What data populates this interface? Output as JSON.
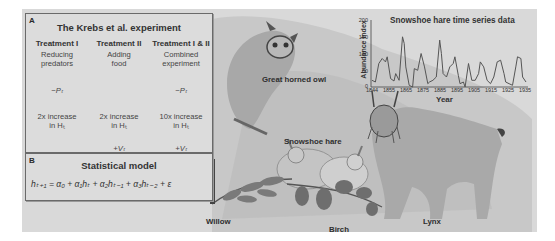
{
  "panel_a": {
    "letter": "A",
    "title": "The Krebs et al. experiment",
    "treatments": [
      {
        "head": "Treatment I",
        "desc_line1": "Reducing",
        "desc_line2": "predators",
        "predator": "−Pₜ",
        "herb_line1": "2x increase",
        "herb_line2": "in Hₜ",
        "veg": ""
      },
      {
        "head": "Treatment II",
        "desc_line1": "Adding",
        "desc_line2": "food",
        "predator": "",
        "herb_line1": "2x increase",
        "herb_line2": "in Hₜ",
        "veg": "+Vₜ"
      },
      {
        "head": "Treatment I & II",
        "desc_line1": "Combined",
        "desc_line2": "experiment",
        "predator": "−Pₜ",
        "herb_line1": "10x increase",
        "herb_line2": "in Hₜ",
        "veg": "+Vₜ"
      }
    ]
  },
  "panel_b": {
    "letter": "B",
    "title": "Statistical model",
    "equation": "hₜ₊₁ = α₀ + α₁hₜ + α₂hₜ₋₁ + α₃hₜ₋₂ + ε"
  },
  "labels": {
    "owl": "Great horned owl",
    "hare": "Snowshoe hare",
    "willow": "Willow",
    "birch": "Birch",
    "lynx": "Lynx"
  },
  "chart_data": {
    "type": "line",
    "title": "Snowshoe hare time series data",
    "xlabel": "Year",
    "ylabel": "Abundance index",
    "ylim": [
      0,
      200
    ],
    "xlim": [
      1844,
      1935
    ],
    "yticks": [
      "0",
      "50",
      "100",
      "150",
      "200"
    ],
    "xticks": [
      "1844",
      "1855",
      "1865",
      "1875",
      "1885",
      "1895",
      "1905",
      "1915",
      "1925",
      "1935"
    ],
    "grid": false,
    "x": [
      1844,
      1846,
      1848,
      1850,
      1852,
      1853,
      1855,
      1857,
      1858,
      1860,
      1862,
      1863,
      1864,
      1866,
      1868,
      1869,
      1871,
      1873,
      1875,
      1877,
      1878,
      1880,
      1882,
      1884,
      1885,
      1886,
      1888,
      1890,
      1892,
      1893,
      1895,
      1896,
      1898,
      1899,
      1901,
      1903,
      1905,
      1907,
      1908,
      1910,
      1912,
      1914,
      1916,
      1918,
      1920,
      1922,
      1923,
      1925,
      1927,
      1929,
      1930,
      1932,
      1933,
      1935
    ],
    "values": [
      20,
      15,
      70,
      85,
      75,
      90,
      25,
      18,
      40,
      20,
      150,
      130,
      60,
      5,
      0,
      55,
      50,
      100,
      60,
      10,
      15,
      20,
      30,
      140,
      100,
      40,
      30,
      60,
      70,
      90,
      35,
      10,
      15,
      0,
      70,
      20,
      20,
      40,
      75,
      60,
      20,
      10,
      30,
      75,
      80,
      40,
      15,
      10,
      5,
      60,
      90,
      85,
      30,
      15
    ]
  }
}
